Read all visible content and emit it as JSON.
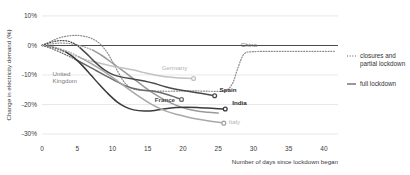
{
  "chart_data": {
    "type": "line",
    "title": "",
    "xlabel": "Number of days since lockdown began",
    "ylabel": "Change in electricity demand (%)",
    "xlim": [
      0,
      42
    ],
    "ylim": [
      -32,
      12
    ],
    "xticks": [
      "0",
      "5",
      "10",
      "15",
      "20",
      "25",
      "30",
      "35",
      "40"
    ],
    "xtick_values": [
      0,
      5,
      10,
      15,
      20,
      25,
      30,
      35,
      40
    ],
    "yticks": [
      "10%",
      "0%",
      "-10%",
      "-20%",
      "-30%"
    ],
    "ytick_values": [
      10,
      0,
      -10,
      -20,
      -30
    ],
    "grid": true,
    "legend_position": "right",
    "legend": [
      {
        "label": "closures and partial lockdown",
        "style": "dotted"
      },
      {
        "label": "full lockdown",
        "style": "solid"
      }
    ],
    "series": [
      {
        "name": "China",
        "color": "#8c8c8c",
        "label_color": "#6e6e6e",
        "label_x": 28.2,
        "label_y": -0.6,
        "end_marker": false,
        "partial": [
          [
            0,
            0
          ],
          [
            1.2,
            1.3
          ],
          [
            2.5,
            2.6
          ],
          [
            4,
            3.3
          ],
          [
            5.5,
            3.3
          ],
          [
            7,
            2.4
          ],
          [
            8.2,
            0.6
          ],
          [
            9.2,
            -2.2
          ],
          [
            10,
            -5.5
          ],
          [
            10.8,
            -9.0
          ],
          [
            11.6,
            -12.2
          ],
          [
            12.6,
            -14.4
          ],
          [
            14,
            -15.2
          ],
          [
            16,
            -15.4
          ],
          [
            18,
            -15.5
          ],
          [
            20,
            -15.4
          ],
          [
            22,
            -15.4
          ],
          [
            24,
            -15.5
          ],
          [
            26,
            -15.3
          ],
          [
            27,
            -13.0
          ],
          [
            27.6,
            -9.0
          ],
          [
            28.2,
            -5.0
          ],
          [
            28.8,
            -2.6
          ],
          [
            30,
            -2.1
          ],
          [
            33,
            -2.0
          ],
          [
            36,
            -2.0
          ],
          [
            39,
            -2.0
          ],
          [
            41.5,
            -2.0
          ]
        ],
        "full": []
      },
      {
        "name": "United Kingdom",
        "color": "#9a9a9a",
        "label_color": "#7a7a7a",
        "label_x": 1.5,
        "label_y": -10.2,
        "end_marker": false,
        "partial": [
          [
            0,
            0
          ],
          [
            1.5,
            0.6
          ],
          [
            3,
            0.8
          ],
          [
            4.5,
            0.4
          ],
          [
            6,
            -0.5
          ],
          [
            7.2,
            -1.6
          ]
        ],
        "full": [
          [
            7.2,
            -1.6
          ],
          [
            8.5,
            -3.4
          ],
          [
            10,
            -6.0
          ],
          [
            11.5,
            -8.6
          ],
          [
            13,
            -11.3
          ],
          [
            14.5,
            -14.0
          ],
          [
            16,
            -16.5
          ],
          [
            17.5,
            -18.6
          ],
          [
            19,
            -20.2
          ],
          [
            20.5,
            -21.4
          ],
          [
            22,
            -22.2
          ],
          [
            23.5,
            -22.6
          ],
          [
            25,
            -22.9
          ]
        ]
      },
      {
        "name": "Germany",
        "color": "#c2c2c2",
        "label_color": "#b0b0b0",
        "label_x": 17.0,
        "label_y": -8.3,
        "end_marker": true,
        "partial": [
          [
            0,
            0
          ],
          [
            1.2,
            -0.6
          ],
          [
            2.5,
            -1.6
          ],
          [
            4,
            -2.9
          ],
          [
            5.5,
            -4.2
          ],
          [
            7,
            -5.3
          ]
        ],
        "full": [
          [
            7,
            -5.3
          ],
          [
            8.5,
            -6.2
          ],
          [
            10,
            -7.0
          ],
          [
            11.5,
            -7.6
          ],
          [
            13,
            -8.3
          ],
          [
            14.5,
            -9.2
          ],
          [
            16,
            -10.0
          ],
          [
            17.5,
            -10.6
          ],
          [
            19,
            -10.9
          ],
          [
            20.5,
            -11.1
          ],
          [
            21.5,
            -11.2
          ]
        ]
      },
      {
        "name": "France",
        "color": "#6b6b6b",
        "label_color": "#4a4a4a",
        "label_x": 16.0,
        "label_y": -19.0,
        "end_marker": true,
        "partial": [
          [
            0,
            0
          ],
          [
            1.2,
            -0.9
          ],
          [
            2.4,
            -2.1
          ],
          [
            3.6,
            -3.4
          ],
          [
            4.8,
            -4.8
          ]
        ],
        "full": [
          [
            4.8,
            -4.8
          ],
          [
            6.2,
            -6.6
          ],
          [
            7.6,
            -8.4
          ],
          [
            9,
            -10.2
          ],
          [
            10.4,
            -12.0
          ],
          [
            11.8,
            -13.6
          ],
          [
            13,
            -14.6
          ],
          [
            14.5,
            -15.2
          ],
          [
            16,
            -15.6
          ],
          [
            17.5,
            -16.4
          ],
          [
            19,
            -17.6
          ],
          [
            19.8,
            -18.3
          ]
        ]
      },
      {
        "name": "Spain",
        "color": "#4a4a4a",
        "label_color": "#2b2b2b",
        "label_x": 25.2,
        "label_y": -15.6,
        "end_marker": true,
        "partial": [
          [
            0,
            0
          ],
          [
            1.2,
            1.0
          ],
          [
            2.4,
            1.6
          ],
          [
            3.6,
            1.5
          ],
          [
            4.6,
            0.6
          ],
          [
            5.4,
            -0.8
          ]
        ],
        "full": [
          [
            5.4,
            -0.8
          ],
          [
            6.5,
            -3.2
          ],
          [
            7.6,
            -5.8
          ],
          [
            8.8,
            -8.2
          ],
          [
            10,
            -9.8
          ],
          [
            11.5,
            -10.8
          ],
          [
            13,
            -11.4
          ],
          [
            14.5,
            -12.0
          ],
          [
            16,
            -12.9
          ],
          [
            17.5,
            -14.0
          ],
          [
            19,
            -14.8
          ],
          [
            20.5,
            -15.4
          ],
          [
            22,
            -16.0
          ],
          [
            23.5,
            -16.6
          ],
          [
            24.5,
            -17.0
          ]
        ]
      },
      {
        "name": "India",
        "color": "#3a3a3a",
        "label_color": "#1f1f1f",
        "label_x": 27.0,
        "label_y": -20.0,
        "end_marker": true,
        "partial": [
          [
            0,
            0
          ],
          [
            1.2,
            -0.4
          ],
          [
            2.4,
            -1.2
          ],
          [
            3.4,
            -2.2
          ]
        ],
        "full": [
          [
            3.4,
            -2.2
          ],
          [
            4.6,
            -4.2
          ],
          [
            5.8,
            -7.0
          ],
          [
            7,
            -10.2
          ],
          [
            8.2,
            -13.4
          ],
          [
            9.4,
            -16.4
          ],
          [
            10.6,
            -19.0
          ],
          [
            11.8,
            -20.8
          ],
          [
            13,
            -21.8
          ],
          [
            14.5,
            -22.2
          ],
          [
            16,
            -22.0
          ],
          [
            17.5,
            -21.4
          ],
          [
            19,
            -21.0
          ],
          [
            20.5,
            -20.9
          ],
          [
            22,
            -21.0
          ],
          [
            23.5,
            -21.2
          ],
          [
            25,
            -21.4
          ],
          [
            26,
            -21.5
          ]
        ]
      },
      {
        "name": "Italy",
        "color": "#a8a8a8",
        "label_color": "#b5b5b5",
        "label_x": 26.5,
        "label_y": -26.6,
        "end_marker": true,
        "partial": [
          [
            0,
            0
          ],
          [
            1.4,
            -0.4
          ],
          [
            2.8,
            -1.3
          ],
          [
            4.2,
            -2.6
          ],
          [
            5.2,
            -3.8
          ]
        ],
        "full": [
          [
            5.2,
            -3.8
          ],
          [
            6.6,
            -5.6
          ],
          [
            8,
            -7.6
          ],
          [
            9.4,
            -9.8
          ],
          [
            10.8,
            -12.2
          ],
          [
            12.2,
            -14.6
          ],
          [
            13.6,
            -17.0
          ],
          [
            15,
            -19.2
          ],
          [
            16.4,
            -21.0
          ],
          [
            17.8,
            -22.4
          ],
          [
            19.2,
            -23.4
          ],
          [
            20.6,
            -24.2
          ],
          [
            22,
            -24.9
          ],
          [
            23.5,
            -25.5
          ],
          [
            25,
            -26.0
          ],
          [
            25.8,
            -26.3
          ]
        ]
      }
    ]
  }
}
